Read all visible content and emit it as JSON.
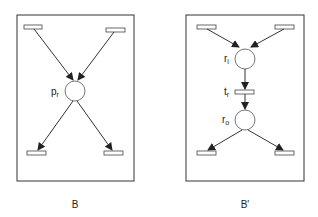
{
  "diagrams": [
    {
      "caption": "B",
      "place_label": {
        "main": "p",
        "sub": "r"
      }
    },
    {
      "caption": "B'",
      "place_in_label": {
        "main": "r",
        "sub": "i"
      },
      "transition_label": {
        "main": "t",
        "sub": "r"
      },
      "place_out_label": {
        "main": "r",
        "sub": "o"
      }
    }
  ],
  "colors": {
    "stroke": "#2a2a2a",
    "fill": "#ffffff"
  }
}
